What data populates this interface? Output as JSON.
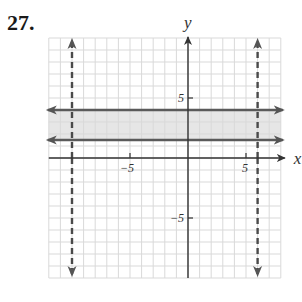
{
  "problem": {
    "number": "27."
  },
  "chart_data": {
    "type": "line",
    "title": "",
    "xlabel": "x",
    "ylabel": "y",
    "xlim": [
      -12,
      8
    ],
    "ylim": [
      -10,
      10
    ],
    "grid": true,
    "x_ticks": [
      {
        "value": -5,
        "label": "−5"
      },
      {
        "value": 5,
        "label": "5"
      }
    ],
    "y_ticks": [
      {
        "value": 5,
        "label": "5"
      },
      {
        "value": -5,
        "label": "−5"
      }
    ],
    "series": [
      {
        "name": "x = -10",
        "kind": "vertical",
        "value": -10,
        "style": "dashed",
        "color": "#4a4a4a"
      },
      {
        "name": "x = 6",
        "kind": "vertical",
        "value": 6,
        "style": "dashed",
        "color": "#4a4a4a"
      },
      {
        "name": "y = 4",
        "kind": "horizontal",
        "value": 4,
        "style": "solid",
        "color": "#5a5a5a"
      },
      {
        "name": "y = 1.5",
        "kind": "horizontal",
        "value": 1.5,
        "style": "solid",
        "color": "#5a5a5a"
      }
    ],
    "shaded_region": {
      "x": [
        -12,
        8
      ],
      "y": [
        1.5,
        4
      ],
      "color": "#e6e6e6"
    }
  },
  "colors": {
    "grid": "#d9d9d9",
    "axis": "#333333",
    "shade": "#e6e6e6",
    "line": "#5a5a5a"
  }
}
